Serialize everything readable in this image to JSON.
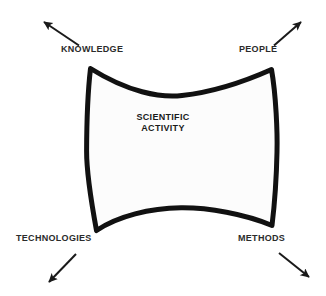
{
  "diagram": {
    "type": "concept-diagram",
    "background_color": "#ffffff",
    "shape": {
      "name": "scientific-activity-shape",
      "fill_color": "#fcfcfc",
      "stroke_color": "#111111",
      "description": "concave-sided quadrilateral / pillow star shape"
    },
    "center": {
      "line1": "SCIENTIFIC",
      "line2": "ACTIVITY"
    },
    "corners": [
      {
        "key": "knowledge",
        "label": "KNOWLEDGE",
        "position": "top-left",
        "arrow_direction": "up-left",
        "arrow_color": "#1a1a1a"
      },
      {
        "key": "people",
        "label": "PEOPLE",
        "position": "top-right",
        "arrow_direction": "up-right",
        "arrow_color": "#1a1a1a"
      },
      {
        "key": "technologies",
        "label": "TECHNOLOGIES",
        "position": "bottom-left",
        "arrow_direction": "down-left",
        "arrow_color": "#1a1a1a"
      },
      {
        "key": "methods",
        "label": "METHODS",
        "position": "bottom-right",
        "arrow_direction": "down-right",
        "arrow_color": "#1a1a1a"
      }
    ]
  }
}
